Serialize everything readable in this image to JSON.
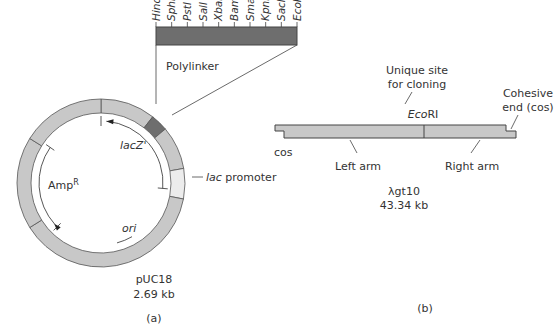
{
  "colors": {
    "ring": "#c8c8c8",
    "ring_stroke": "#555555",
    "polylinker": "#6e6e6e",
    "lac_promoter": "#ececec",
    "lambda_bar": "#c8c8c8",
    "line": "#444444"
  },
  "panel_a": {
    "polylinker_sites": [
      "HindIII",
      "SphI",
      "PstI",
      "SalI",
      "XbaI",
      "BamHI",
      "SmaI",
      "KpnI",
      "SacI",
      "EcoRI"
    ],
    "polylinker_label": "Polylinker",
    "lacz_label": "lacZ'",
    "lac_promoter_label_italic": "lac",
    "lac_promoter_label_rest": " promoter",
    "ampr_label": "Amp",
    "ampr_superscript": "R",
    "ori_label": "ori",
    "plasmid_name": "pUC18",
    "plasmid_size": "2.69 kb",
    "caption": "(a)"
  },
  "panel_b": {
    "unique_site_line1": "Unique site",
    "unique_site_line2": "for cloning",
    "ecori_italic": "Eco",
    "ecori_rest": "RI",
    "cohesive_line1": "Cohesive",
    "cohesive_line2": "end (cos)",
    "cos_label": "cos",
    "left_arm_label": "Left arm",
    "right_arm_label": "Right arm",
    "phage_name": "λgt10",
    "phage_size": "43.34 kb",
    "caption": "(b)"
  }
}
